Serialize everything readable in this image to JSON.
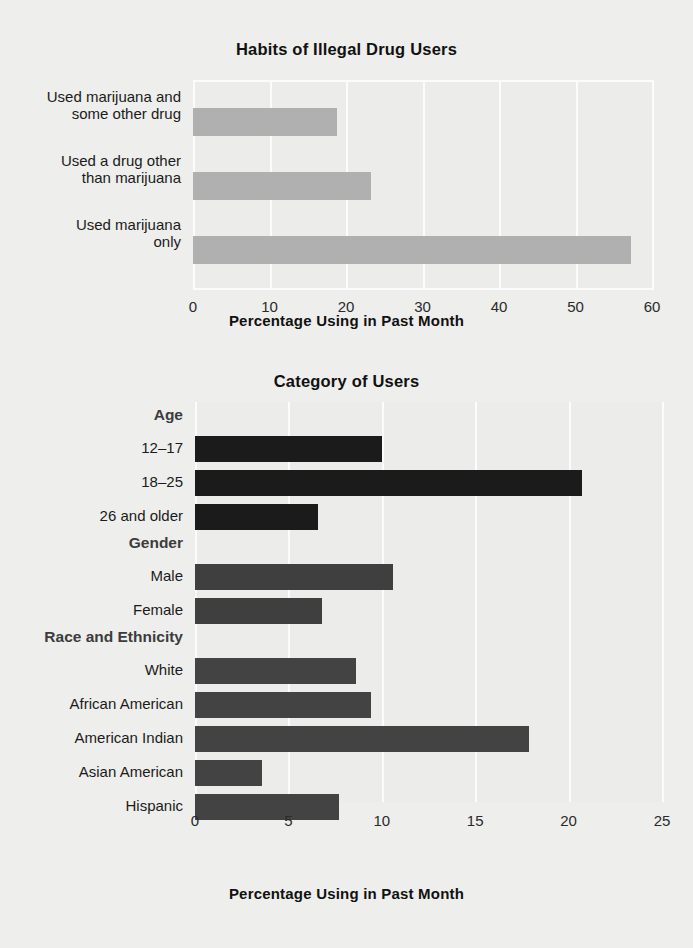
{
  "figure": {
    "background_color": "#eeeeec",
    "grid_color": "#fcfcfc"
  },
  "chart_data": [
    {
      "id": "habits",
      "type": "bar",
      "orientation": "horizontal",
      "title": "Habits of Illegal Drug Users",
      "xlabel": "Percentage Using in Past Month",
      "ylabel": "",
      "xlim": [
        0,
        60
      ],
      "xticks": [
        0,
        10,
        20,
        30,
        40,
        50,
        60
      ],
      "xtick_labels": [
        "0",
        "10",
        "20",
        "30",
        "40",
        "50",
        "60"
      ],
      "grid": true,
      "legend": "none",
      "bar_color": "#b0b0b0",
      "categories": [
        "Used marijuana\nonly",
        "Used a drug other\nthan marijuana",
        "Used marijuana and\nsome other drug"
      ],
      "category_lines": [
        [
          "Used marijuana and",
          "some other drug"
        ],
        [
          "Used a drug other",
          "than marijuana"
        ],
        [
          "Used marijuana",
          "only"
        ]
      ],
      "values_top_to_bottom": [
        18.8,
        23.3,
        57.3
      ],
      "values": [
        57.3,
        23.3,
        18.8
      ]
    },
    {
      "id": "category-of-users",
      "type": "bar",
      "orientation": "horizontal",
      "title": "Category of Users",
      "xlabel": "Percentage Using in Past Month",
      "ylabel": "",
      "xlim": [
        0,
        25
      ],
      "xticks": [
        0,
        5,
        10,
        15,
        20,
        25
      ],
      "xtick_labels": [
        "0",
        "5",
        "10",
        "15",
        "20",
        "25"
      ],
      "grid": true,
      "legend": "none",
      "groups": [
        {
          "name": "Age",
          "bar_color": "#1b1b1b",
          "categories": [
            "12–17",
            "18–25",
            "26 and older"
          ],
          "values": [
            10.0,
            20.7,
            6.6
          ]
        },
        {
          "name": "Gender",
          "bar_color": "#3f3f3f",
          "categories": [
            "Male",
            "Female"
          ],
          "values": [
            10.6,
            6.8
          ]
        },
        {
          "name": "Race and Ethnicity",
          "bar_color": "#434343",
          "categories": [
            "White",
            "African American",
            "American Indian",
            "Asian American",
            "Hispanic"
          ],
          "values": [
            8.6,
            9.4,
            17.9,
            3.6,
            7.7
          ]
        }
      ]
    }
  ]
}
